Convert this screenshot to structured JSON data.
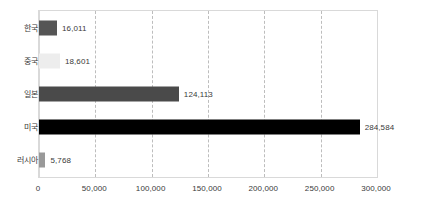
{
  "chart_data": {
    "type": "bar",
    "orientation": "horizontal",
    "title": "",
    "xlabel": "",
    "ylabel": "",
    "xlim": [
      0,
      300000
    ],
    "grid": true,
    "legend": false,
    "categories": [
      "한국",
      "중국",
      "일본",
      "미국",
      "러시아"
    ],
    "values": [
      16011,
      18601,
      124113,
      284584,
      5768
    ],
    "value_labels": [
      "16,011",
      "18,601",
      "124,113",
      "284,584",
      "5,768"
    ],
    "bar_colors": [
      "#555555",
      "#ededed",
      "#4a4a4a",
      "#000000",
      "#999999"
    ],
    "xticks": [
      0,
      50000,
      100000,
      150000,
      200000,
      250000,
      300000
    ],
    "xtick_labels": [
      "0",
      "50,000",
      "100,000",
      "150,000",
      "200,000",
      "250,000",
      "300,000"
    ]
  }
}
